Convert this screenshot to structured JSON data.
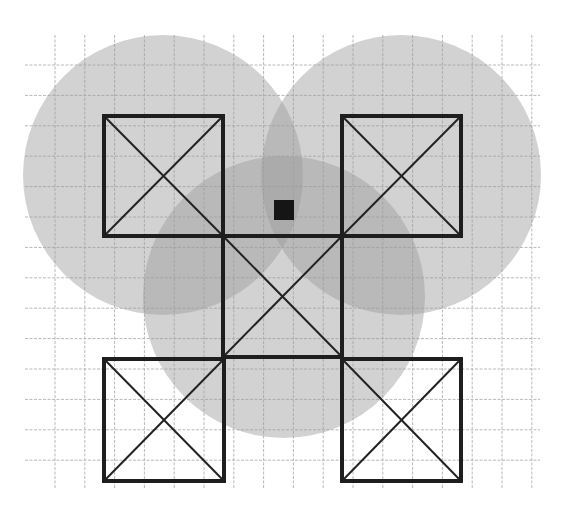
{
  "canvas": {
    "width": 562,
    "height": 505,
    "background": "#ffffff"
  },
  "grid": {
    "color": "#b8b8b8",
    "x_start": 25,
    "x_end": 540,
    "y_start": 35,
    "y_end": 488,
    "vertical_lines_x": [
      55,
      84.8,
      114.6,
      144.4,
      174.2,
      204,
      233.8,
      263.6,
      293.4,
      323.2,
      353,
      382.8,
      412.6,
      442.4,
      472.2,
      502,
      531.8
    ],
    "horizontal_lines_y": [
      65,
      95.4,
      125.8,
      156.2,
      186.6,
      217,
      247.4,
      277.8,
      308.2,
      338.6,
      369,
      399.4,
      429.8,
      460.2
    ]
  },
  "circles": [
    {
      "id": "coverage-left",
      "cx": 163,
      "cy": 175,
      "r": 140,
      "color": "#9c9c9c"
    },
    {
      "id": "coverage-right",
      "cx": 401,
      "cy": 175,
      "r": 140,
      "color": "#9c9c9c"
    },
    {
      "id": "coverage-center",
      "cx": 284,
      "cy": 297,
      "r": 141,
      "color": "#9c9c9c"
    }
  ],
  "cells": [
    {
      "id": "cell-top-left",
      "x": 104,
      "y": 116,
      "w": 119,
      "h": 120
    },
    {
      "id": "cell-top-right",
      "x": 342,
      "y": 116,
      "w": 119,
      "h": 120
    },
    {
      "id": "cell-center",
      "x": 223,
      "y": 236,
      "w": 119,
      "h": 121
    },
    {
      "id": "cell-bottom-left",
      "x": 104,
      "y": 359,
      "w": 120,
      "h": 122
    },
    {
      "id": "cell-bottom-right",
      "x": 342,
      "y": 359,
      "w": 119,
      "h": 122
    }
  ],
  "marker": {
    "id": "center-marker",
    "x": 274,
    "y": 200,
    "w": 20,
    "h": 20,
    "color": "#151515"
  },
  "colors": {
    "frame": "#1e1e1e",
    "diagonal": "#222222"
  }
}
